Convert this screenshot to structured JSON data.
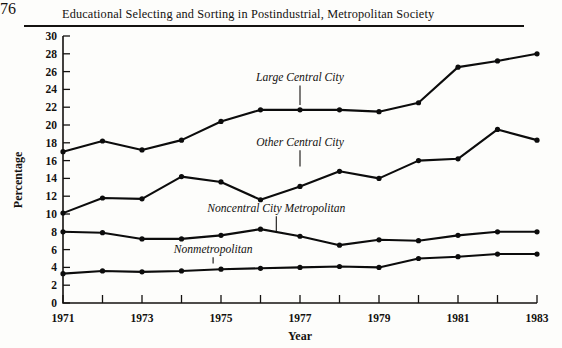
{
  "header": {
    "page_number": "76",
    "title": "Educational Selecting and Sorting in Postindustrial, Metropolitan Society"
  },
  "chart_data": {
    "type": "line",
    "title": "",
    "xlabel": "Year",
    "ylabel": "Percentage",
    "x": [
      1971,
      1972,
      1973,
      1974,
      1975,
      1976,
      1977,
      1978,
      1979,
      1980,
      1981,
      1982,
      1983
    ],
    "xlim": [
      1971,
      1983
    ],
    "ylim": [
      0,
      30
    ],
    "ytick_step": 2,
    "yticks": [
      0,
      2,
      4,
      6,
      8,
      10,
      12,
      14,
      16,
      18,
      20,
      22,
      24,
      26,
      28,
      30
    ],
    "ytick_labels": [
      "0",
      "2",
      "4",
      "6",
      "8",
      "10",
      "12",
      "14",
      "16",
      "18",
      "20",
      "22",
      "24",
      "26",
      "28",
      "30"
    ],
    "xticks": [
      1971,
      1972,
      1973,
      1974,
      1975,
      1976,
      1977,
      1978,
      1979,
      1980,
      1981,
      1982,
      1983
    ],
    "xtick_labels": [
      "1971",
      "",
      "1973",
      "",
      "1975",
      "",
      "1977",
      "",
      "1979",
      "",
      "1981",
      "",
      "1983"
    ],
    "grid": false,
    "legend_position": "inline-annotations",
    "marker": "filled-circle",
    "line_color": "#0c0c0c",
    "series": [
      {
        "name": "Large Central City",
        "values": [
          17.0,
          18.2,
          17.2,
          18.3,
          20.4,
          21.7,
          21.7,
          21.7,
          21.5,
          22.5,
          26.5,
          27.2,
          28.0
        ],
        "label_x": 1977.0,
        "label_y": 24.9,
        "leader_to_y": 21.8
      },
      {
        "name": "Other Central City",
        "values": [
          10.1,
          11.8,
          11.7,
          14.2,
          13.6,
          11.6,
          13.1,
          14.8,
          14.0,
          16.0,
          16.2,
          19.5,
          18.3
        ],
        "label_x": 1977.0,
        "label_y": 17.6,
        "leader_to_y": 14.9
      },
      {
        "name": "Noncentral City Metropolitan",
        "values": [
          8.0,
          7.9,
          7.2,
          7.2,
          7.6,
          8.3,
          7.5,
          6.5,
          7.1,
          7.0,
          7.6,
          8.0,
          8.0
        ],
        "label_x": 1976.4,
        "label_y": 10.2,
        "leader_to_y": 7.6
      },
      {
        "name": "Nonmetropolitan",
        "values": [
          3.3,
          3.6,
          3.5,
          3.6,
          3.8,
          3.9,
          4.0,
          4.1,
          4.0,
          5.0,
          5.2,
          5.5,
          5.5
        ],
        "label_x": 1974.8,
        "label_y": 5.6,
        "leader_to_y": 4.0
      }
    ]
  }
}
